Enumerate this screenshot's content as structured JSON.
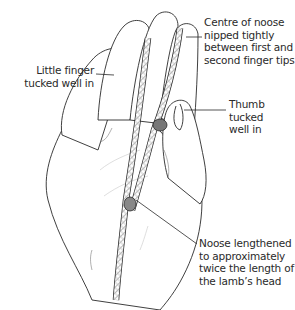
{
  "figure": {
    "labels": {
      "little_finger": {
        "lines": [
          "Little finger",
          "tucked well in"
        ]
      },
      "centre_of_noose": {
        "lines": [
          "Centre of noose",
          "nipped tightly",
          "between first and",
          "second finger tips."
        ]
      },
      "thumb": {
        "lines": [
          "Thumb",
          "tucked",
          "well in"
        ]
      },
      "noose_length": {
        "lines": [
          "Noose lengthened",
          "to approximately",
          "twice the length of",
          "the lamb’s head"
        ]
      }
    },
    "colors": {
      "line": "#2a2a2a",
      "rope": "#9a9a9a",
      "background": "#ffffff"
    }
  }
}
